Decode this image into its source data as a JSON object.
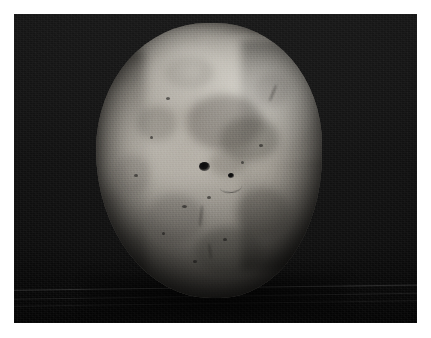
{
  "page": {
    "background_color": "#ffffff",
    "width": 431,
    "height": 338
  },
  "photo": {
    "name": "potato-photograph",
    "description": "Close-up photograph of a single roundish potato tuber on a dark background",
    "frame": {
      "left": 14,
      "top": 14,
      "width": 403,
      "height": 309,
      "border_color": "#ffffff"
    },
    "background": {
      "color": "#0d0d0d",
      "secondary_color": "#151515",
      "texture": "fine-grain-dark-cloth"
    },
    "subject": {
      "label": "potato",
      "shape": "rounded ovoid, slightly flattened top-left shoulder",
      "skin_color_light": "#d6d3cc",
      "skin_color_mid": "#a9a49b",
      "skin_color_dark": "#6d6a64",
      "bounds": {
        "left": 96,
        "top": 23,
        "right": 322,
        "bottom": 298
      },
      "lighting": "key light from upper right, bottom in shadow",
      "features": [
        {
          "name": "eye-dimple-left",
          "x": 196,
          "y": 157
        },
        {
          "name": "eye-dimple-right",
          "x": 227,
          "y": 163
        },
        {
          "name": "highlight-upper-right",
          "x": 278,
          "y": 82
        },
        {
          "name": "highlight-top-center",
          "x": 205,
          "y": 52
        }
      ]
    },
    "surface_lines": [
      {
        "name": "table-edge-line-1",
        "y": 290
      },
      {
        "name": "table-edge-line-2",
        "y": 299
      },
      {
        "name": "table-edge-line-3",
        "y": 306
      }
    ]
  }
}
